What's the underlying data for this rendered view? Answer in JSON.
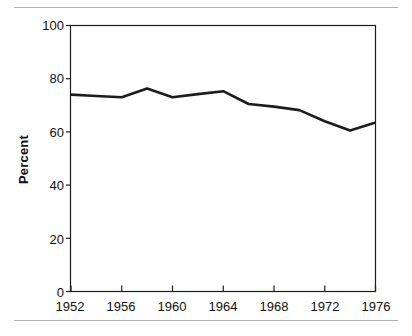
{
  "figure": {
    "background_color": "#ffffff",
    "rule_color": "#b4b4b4",
    "line_color": "#1c1c1c",
    "axis_color": "#1c1c1c"
  },
  "axis": {
    "ylabel": "Percent",
    "y_ticks": [
      "0",
      "20",
      "40",
      "60",
      "80",
      "100"
    ],
    "x_ticks": [
      "1952",
      "1956",
      "1960",
      "1964",
      "1968",
      "1972",
      "1976"
    ]
  },
  "chart_data": {
    "type": "line",
    "title": "",
    "subtitle": "",
    "xlabel": "",
    "ylabel": "Percent",
    "xlim": [
      1952,
      1976
    ],
    "ylim": [
      0,
      100
    ],
    "grid": false,
    "legend": false,
    "legend_position": "none",
    "x_tick_values": [
      1952,
      1956,
      1960,
      1964,
      1968,
      1972,
      1976
    ],
    "y_tick_values": [
      0,
      20,
      40,
      60,
      80,
      100
    ],
    "annotations": [],
    "series": [
      {
        "name": "Percent",
        "color": "#1c1c1c",
        "x": [
          1952,
          1954,
          1956,
          1958,
          1960,
          1962,
          1964,
          1966,
          1968,
          1970,
          1972,
          1974,
          1976
        ],
        "values": [
          74.0,
          73.5,
          73.0,
          76.3,
          73.0,
          74.2,
          75.3,
          70.5,
          69.5,
          68.2,
          64.0,
          60.5,
          63.5
        ]
      }
    ]
  }
}
